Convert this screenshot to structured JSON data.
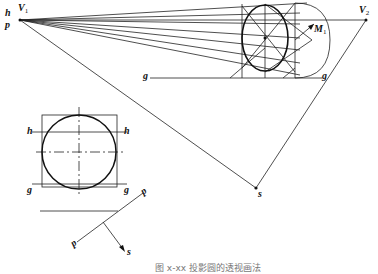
{
  "figure": {
    "caption": "图 x-xx 投影圆的透视画法",
    "labels": {
      "h_top": "h",
      "p_top": "p",
      "V1": "V",
      "V1_sub": "1",
      "V2": "V",
      "V2_sub": "2",
      "M1": "M",
      "M1_sub": "1",
      "g_line": "g",
      "g_right": "g",
      "s_point": "s",
      "h_left": "h",
      "h_right": "h",
      "g_left": "g",
      "g_right2": "g",
      "p_upper": "p",
      "p_lower": "p",
      "s_arrow": "s"
    },
    "colors": {
      "line": "#222222",
      "thick": "#111111",
      "background": "#ffffff"
    }
  }
}
